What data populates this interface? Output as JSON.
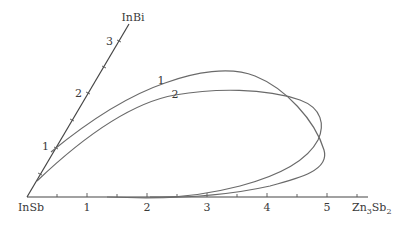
{
  "diagram": {
    "vertices": {
      "origin": "InSb",
      "top": "InBi",
      "right_main": "Zn",
      "right_sub1": "3",
      "right_mid": "Sb",
      "right_sub2": "2"
    },
    "horizontal_axis": {
      "ticks": [
        "1",
        "2",
        "3",
        "4",
        "5"
      ]
    },
    "diagonal_axis": {
      "ticks": [
        "1",
        "2",
        "3"
      ]
    },
    "curves": [
      {
        "label": "1"
      },
      {
        "label": "2"
      }
    ],
    "colors": {
      "axis": "#444444",
      "curve": "#6a6a6a",
      "text": "#3a3a3a"
    }
  }
}
